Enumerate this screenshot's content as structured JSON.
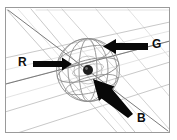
{
  "figure": {
    "name": "rgb-light-vectors-on-sphere",
    "background_color": "#ffffff",
    "frame": {
      "border_color": "#9a9a9a",
      "x": 5,
      "y": 7,
      "width": 165,
      "height": 126
    },
    "geometry": {
      "sphere_center": {
        "x": 88,
        "y": 70
      },
      "sphere_radius_x": 32,
      "sphere_radius_y": 32,
      "center_dot_radius": 5,
      "center_dot_color": "#1c1c1c",
      "grid_color": "#b9b9b9",
      "sphere_wire_color": "#8d8d8d",
      "axis_color": "#6f6f6f"
    },
    "arrows": [
      {
        "id": "arrow-R",
        "label": "R",
        "color": "#080808",
        "label_x": 18,
        "label_y": 56,
        "tail": {
          "x": 33,
          "y": 64
        },
        "tip": {
          "x": 71,
          "y": 64
        },
        "direction": "points right toward centre",
        "shaft_thickness": 6,
        "head_length": 12,
        "head_width": 15
      },
      {
        "id": "arrow-G",
        "label": "G",
        "color": "#080808",
        "label_x": 152,
        "label_y": 38,
        "tail": {
          "x": 147,
          "y": 46
        },
        "tip": {
          "x": 102,
          "y": 46
        },
        "direction": "points left toward centre",
        "shaft_thickness": 6,
        "head_length": 13,
        "head_width": 16
      },
      {
        "id": "arrow-B",
        "label": "B",
        "color": "#080808",
        "label_x": 137,
        "label_y": 112,
        "tail": {
          "x": 130,
          "y": 112
        },
        "tip": {
          "x": 93,
          "y": 80
        },
        "direction": "points up-left toward centre",
        "shaft_thickness": 6,
        "head_length": 15,
        "head_width": 17
      }
    ],
    "grid": {
      "ground_lines_running_left_to_right": 4,
      "ground_lines_running_front_to_back": 5,
      "perspective": "two-point, vanishing toward upper right"
    },
    "sphere_wires": {
      "meridians": 4,
      "parallels": 3
    }
  }
}
